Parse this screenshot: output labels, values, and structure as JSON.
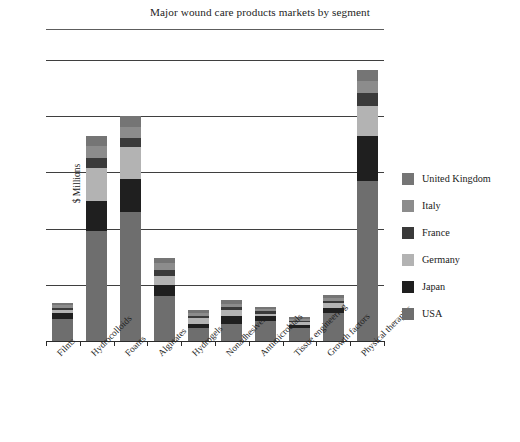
{
  "chart_data": {
    "type": "bar",
    "title": "Major wound care products markets by segment",
    "xlabel": "",
    "ylabel": "$ Millions",
    "stacked": true,
    "grid": true,
    "legend_position": "right",
    "ylim": [
      0,
      1000
    ],
    "y_tick_labels": [],
    "gridline_values": [
      200,
      400,
      600,
      800,
      1000
    ],
    "categories": [
      "Films",
      "Hydrocolloids",
      "Foams",
      "Alginates",
      "Hydrogels",
      "Nonadhesives",
      "Antimicrobials",
      "Tissue engineering",
      "Growth factors",
      "Physical therapies"
    ],
    "series": [
      {
        "name": "USA",
        "color": "#6e6e6e",
        "values": [
          80,
          390,
          460,
          160,
          48,
          60,
          70,
          48,
          100,
          570
        ]
      },
      {
        "name": "Japan",
        "color": "#1f1f1f",
        "values": [
          20,
          110,
          115,
          40,
          12,
          30,
          18,
          10,
          18,
          160
        ]
      },
      {
        "name": "Germany",
        "color": "#b3b3b3",
        "values": [
          10,
          115,
          115,
          30,
          22,
          22,
          10,
          8,
          16,
          105
        ]
      },
      {
        "name": "France",
        "color": "#3a3a3a",
        "values": [
          9,
          38,
          32,
          24,
          8,
          10,
          8,
          6,
          10,
          48
        ]
      },
      {
        "name": "Italy",
        "color": "#8c8c8c",
        "values": [
          8,
          40,
          40,
          22,
          10,
          10,
          8,
          6,
          10,
          42
        ]
      },
      {
        "name": "United Kingdom",
        "color": "#757575",
        "values": [
          8,
          35,
          38,
          20,
          10,
          14,
          8,
          6,
          10,
          40
        ]
      }
    ]
  },
  "legend": {
    "entries": [
      {
        "label": "United Kingdom",
        "color": "#757575"
      },
      {
        "label": "Italy",
        "color": "#8c8c8c"
      },
      {
        "label": "France",
        "color": "#3a3a3a"
      },
      {
        "label": "Germany",
        "color": "#b3b3b3"
      },
      {
        "label": "Japan",
        "color": "#1f1f1f"
      },
      {
        "label": "USA",
        "color": "#6e6e6e"
      }
    ]
  }
}
